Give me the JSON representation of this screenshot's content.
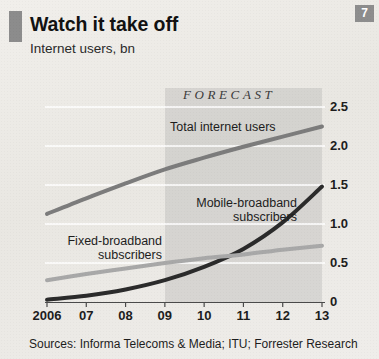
{
  "header": {
    "badge": "7",
    "title": "Watch it take off",
    "subtitle": "Internet users, bn"
  },
  "footer": {
    "source": "Sources: Informa Telecoms & Media; ITU; Forrester Research"
  },
  "annotations": {
    "forecast": "FORECAST"
  },
  "colors": {
    "background": "#eceae6",
    "marker": "#8c8c8c",
    "badge": "#8d8d8d",
    "forecast_band": "rgba(155,155,155,0.26)",
    "total_internet_users": "#7c7c7c",
    "mobile_broadband": "#2b2b2b",
    "fixed_broadband": "#a8a8a8",
    "gridline": "#ffffff",
    "axis": "#4a4a4a"
  },
  "chart_data": {
    "type": "line",
    "title": "Watch it take off",
    "subtitle": "Internet users, bn",
    "xlabel": "",
    "ylabel": "Internet users, bn",
    "ylim": [
      0,
      2.75
    ],
    "yticks": [
      0,
      0.5,
      1.0,
      1.5,
      2.0,
      2.5
    ],
    "ytick_labels": [
      "0",
      "0.5",
      "1.0",
      "1.5",
      "2.0",
      "2.5"
    ],
    "grid": true,
    "grid_axis": "y",
    "legend": "inline-labels",
    "x": [
      2006,
      2007,
      2008,
      2009,
      2010,
      2011,
      2012,
      2013
    ],
    "categories": [
      "2006",
      "07",
      "08",
      "09",
      "10",
      "11",
      "12",
      "13"
    ],
    "forecast_from": "09",
    "annotations": [
      {
        "text": "FORECAST",
        "x": "09",
        "position": "top"
      }
    ],
    "series": [
      {
        "name": "Total internet users",
        "color": "#7c7c7c",
        "width": 4,
        "label_x": "09",
        "values": [
          1.13,
          1.33,
          1.52,
          1.7,
          1.85,
          1.99,
          2.12,
          2.25
        ]
      },
      {
        "name": "Mobile-broadband subscribers",
        "color": "#2b2b2b",
        "width": 4,
        "label_x": "11",
        "values": [
          0.03,
          0.08,
          0.16,
          0.28,
          0.45,
          0.68,
          1.02,
          1.48
        ]
      },
      {
        "name": "Fixed-broadband subscribers",
        "color": "#a8a8a8",
        "width": 4,
        "label_x": "08",
        "values": [
          0.28,
          0.36,
          0.43,
          0.5,
          0.56,
          0.61,
          0.67,
          0.72
        ]
      }
    ]
  },
  "series_labels": [
    {
      "name": "Total internet users",
      "text": "Total internet users"
    },
    {
      "name": "Mobile-broadband subscribers",
      "text": "Mobile-broadband\nsubscribers"
    },
    {
      "name": "Fixed-broadband subscribers",
      "text": "Fixed-broadband\nsubscribers"
    }
  ]
}
